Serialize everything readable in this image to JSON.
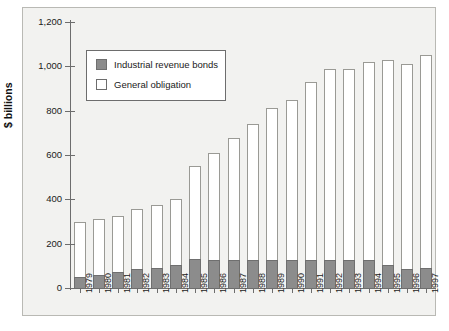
{
  "chart_data": {
    "type": "bar",
    "subtype": "stacked-vertical",
    "title": "",
    "xlabel": "",
    "ylabel": "$ billions",
    "ylim": [
      0,
      1200
    ],
    "yticks": [
      0,
      200,
      400,
      600,
      800,
      1000,
      1200
    ],
    "ytick_labels": [
      "0",
      "200",
      "400",
      "600",
      "800",
      "1,000",
      "1,200"
    ],
    "grid": false,
    "legend_position": "upper-left-inside",
    "categories": [
      "1979",
      "1980",
      "1981",
      "1982",
      "1983",
      "1984",
      "1985",
      "1986",
      "1987",
      "1988",
      "1989",
      "1990",
      "1991",
      "1992",
      "1993",
      "1994",
      "1995",
      "1996",
      "1997"
    ],
    "series": [
      {
        "name": "Industrial revenue bonds",
        "color": "#8c8c8c",
        "values": [
          50,
          60,
          70,
          85,
          90,
          105,
          130,
          125,
          125,
          125,
          125,
          125,
          125,
          125,
          125,
          125,
          105,
          85,
          90
        ]
      },
      {
        "name": "General obligation",
        "color": "#ffffff",
        "values": [
          250,
          250,
          255,
          270,
          285,
          295,
          420,
          485,
          550,
          615,
          685,
          725,
          805,
          865,
          865,
          895,
          925,
          925,
          960
        ]
      }
    ],
    "totals": [
      300,
      310,
      325,
      355,
      375,
      400,
      550,
      610,
      675,
      740,
      810,
      850,
      930,
      990,
      990,
      1020,
      1030,
      1010,
      1050
    ]
  },
  "legend": {
    "items": [
      {
        "label": "Industrial revenue bonds",
        "swatch": "industrial-swatch"
      },
      {
        "label": "General obligation",
        "swatch": "general-swatch"
      }
    ]
  },
  "axis": {
    "y_title": "$ billions"
  },
  "colors": {
    "industrial": "#8c8c8c",
    "general": "#ffffff",
    "panel_background": "#f2f2f0",
    "axis": "#6d6d6d",
    "text": "#1a1a1a"
  }
}
